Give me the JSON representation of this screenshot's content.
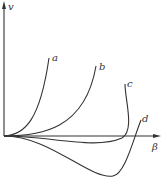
{
  "diagram": {
    "axes": {
      "y_label": "v",
      "x_label": "β"
    },
    "curves": [
      {
        "label": "a"
      },
      {
        "label": "b"
      },
      {
        "label": "c"
      },
      {
        "label": "d"
      }
    ],
    "colors": {
      "line": "#333333",
      "background": "#ffffff"
    }
  }
}
